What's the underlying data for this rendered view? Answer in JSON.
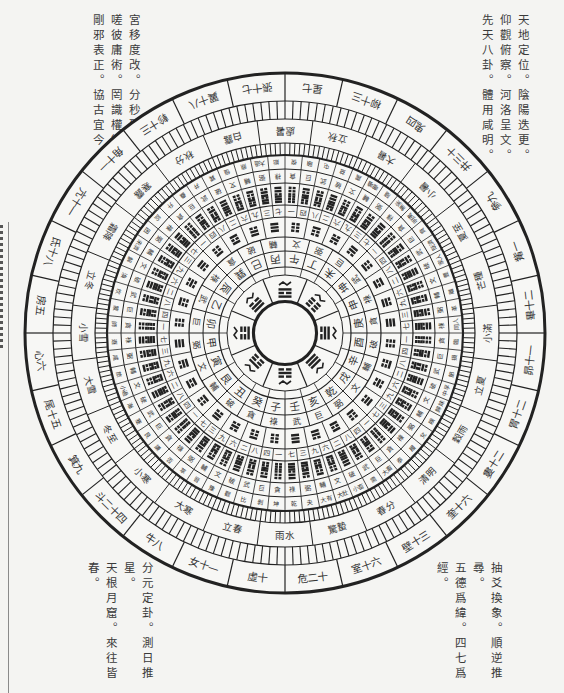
{
  "verses": {
    "top_left": [
      "宮移度改。分秒殊情。",
      "嗟彼庸術。罔識權衡。",
      "剛邪表正。協古宜今。"
    ],
    "top_right": [
      "天地定位。陰陽迭更。",
      "仰觀俯察。河洛呈文。",
      "先天八卦。體用咸明。"
    ],
    "bottom_left": [
      "分元定卦。測日推星。",
      "天根月窟。來往皆春。"
    ],
    "bottom_right": [
      "抽爻換象。順逆推尋。",
      "五德爲緯。四七爲經。"
    ]
  },
  "compass": {
    "center": [
      285,
      333
    ],
    "colors": {
      "line": "#222222",
      "paper": "#f4f4f2",
      "text": "#333333"
    },
    "lunar_mansions": [
      "虛十",
      "女十一",
      "牛八",
      "斗二十四",
      "箕九",
      "尾十五",
      "心六",
      "房五",
      "氐十八",
      "亢十一",
      "角十一",
      "軫十三",
      "翼十八",
      "張十七",
      "星七",
      "柳十三",
      "鬼四",
      "井三十",
      "參九",
      "觜一",
      "畢十二",
      "昴十一",
      "胃十二",
      "婁十二",
      "奎十六",
      "壁十三",
      "室十六",
      "危二十"
    ],
    "solar_terms": [
      "立春",
      "大寒",
      "小寒",
      "冬至",
      "大雪",
      "小雪",
      "立冬",
      "霜降",
      "寒露",
      "秋分",
      "白露",
      "處暑",
      "立秋",
      "大暑",
      "小暑",
      "夏至",
      "芒種",
      "小滿",
      "立夏",
      "穀雨",
      "清明",
      "春分",
      "驚蟄",
      "雨水"
    ],
    "mountains": [
      "子",
      "癸",
      "丑",
      "艮",
      "寅",
      "甲",
      "卯",
      "乙",
      "辰",
      "巽",
      "巳",
      "丙",
      "午",
      "丁",
      "未",
      "坤",
      "申",
      "庚",
      "酉",
      "辛",
      "戌",
      "乾",
      "亥",
      "壬"
    ],
    "stars": [
      "祿",
      "貪",
      "破",
      "輔",
      "文",
      "弼",
      "巨",
      "武",
      "祿",
      "貪",
      "破",
      "輔",
      "文",
      "弼",
      "巨",
      "武",
      "祿",
      "貪",
      "破",
      "輔",
      "文",
      "弼",
      "巨",
      "武"
    ],
    "hexagram_names": [
      "坤",
      "剝",
      "比",
      "觀",
      "豫",
      "晉",
      "萃",
      "否",
      "謙",
      "艮",
      "蹇",
      "漸",
      "小過",
      "旅",
      "咸",
      "遯",
      "師",
      "蒙",
      "坎",
      "渙",
      "解",
      "未濟",
      "困",
      "訟",
      "升",
      "蠱",
      "井",
      "巽",
      "恒",
      "鼎",
      "大過",
      "姤",
      "復",
      "頤",
      "屯",
      "益",
      "震",
      "噬嗑",
      "隨",
      "無妄",
      "明夷",
      "賁",
      "既濟",
      "家人",
      "豐",
      "離",
      "革",
      "同人",
      "臨",
      "損",
      "節",
      "中孚",
      "歸妹",
      "睽",
      "兌",
      "履",
      "泰",
      "大畜",
      "需",
      "小畜",
      "大壯",
      "大有",
      "夬",
      "乾"
    ],
    "hexagram_stars": [
      "貪",
      "巨",
      "武",
      "破",
      "文",
      "輔",
      "弼",
      "祿"
    ],
    "numbers": [
      "一",
      "二",
      "三",
      "四",
      "六",
      "七",
      "八",
      "九"
    ],
    "inner_trigrams": [
      "坎",
      "艮",
      "震",
      "巽",
      "離",
      "坤",
      "兌",
      "乾"
    ]
  }
}
